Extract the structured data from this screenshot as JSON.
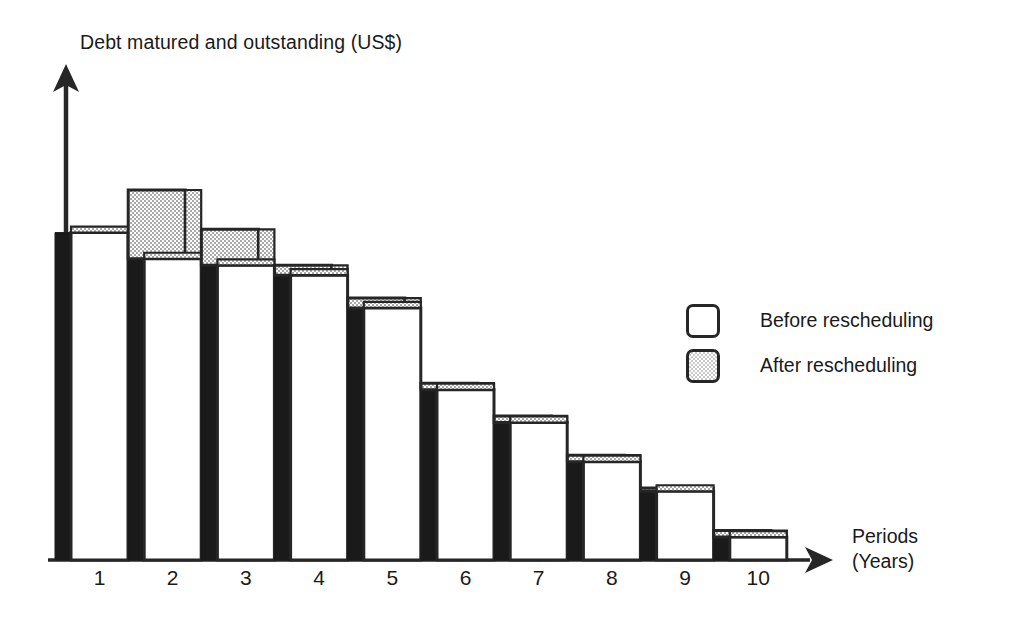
{
  "chart_data": {
    "type": "bar",
    "title": "",
    "ylabel": "Debt matured and outstanding (US$)",
    "xlabel": "Periods (Years)",
    "xlabel_line1": "Periods",
    "xlabel_line2": "(Years)",
    "categories": [
      "1",
      "2",
      "3",
      "4",
      "5",
      "6",
      "7",
      "8",
      "9",
      "10"
    ],
    "grid": false,
    "legend_position": "right",
    "axis_values_shown": false,
    "series": [
      {
        "name": "Before rescheduling",
        "style": "white",
        "values": [
          100,
          92,
          90,
          87,
          77,
          52,
          42,
          30,
          21,
          7
        ]
      },
      {
        "name": "After rescheduling",
        "style": "gray-stipple",
        "values": [
          100,
          113,
          101,
          90,
          80,
          54,
          44,
          32,
          22,
          9
        ]
      }
    ]
  },
  "legend": {
    "items": [
      {
        "label": "Before rescheduling",
        "swatch": "white-square"
      },
      {
        "label": "After rescheduling",
        "swatch": "gray-stipple-square"
      }
    ]
  },
  "colors": {
    "ink": "#262626",
    "gray_fill": "#c9c9c9",
    "shadow": "#1a1a1a",
    "white_fill": "#ffffff",
    "background": "#ffffff"
  },
  "axes": {
    "y_arrow": "up-arrow",
    "x_arrow": "right-arrow"
  }
}
